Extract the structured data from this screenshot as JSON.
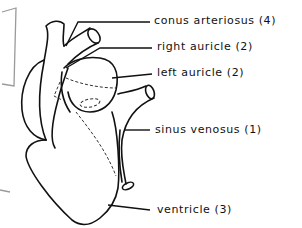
{
  "diagram": {
    "labels": [
      {
        "id": "conus-arteriosus",
        "text": "conus arteriosus (4)"
      },
      {
        "id": "right-auricle",
        "text": "right auricle (2)"
      },
      {
        "id": "left-auricle",
        "text": "left auricle (2)"
      },
      {
        "id": "sinus-venosus",
        "text": "sinus venosus (1)"
      },
      {
        "id": "ventricle",
        "text": "ventricle (3)"
      }
    ]
  }
}
